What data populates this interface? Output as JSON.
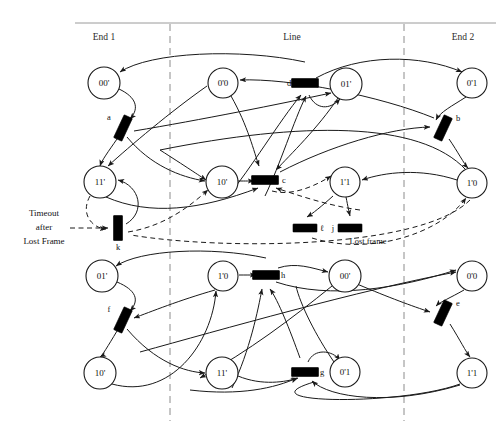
{
  "figure": {
    "kind": "petri-net",
    "background_color": "#ffffff",
    "ink_color": "#1a1a1a",
    "lane_divider_color": "#8c8c8c"
  },
  "lanes": {
    "titles": [
      {
        "id": "end1",
        "label": "End 1",
        "x": 104,
        "y": 37
      },
      {
        "id": "line",
        "label": "Line",
        "x": 292,
        "y": 37
      },
      {
        "id": "end2",
        "label": "End 2",
        "x": 463,
        "y": 37
      }
    ],
    "dividers": [
      {
        "id": "divider-left",
        "x": 170,
        "y1": 24,
        "y2": 421
      },
      {
        "id": "divider-right",
        "x": 404,
        "y1": 24,
        "y2": 421
      }
    ],
    "top_rule": {
      "x1": 75,
      "x2": 496,
      "y": 23
    }
  },
  "places": [
    {
      "id": "p-top-00a",
      "label": "00'",
      "x": 104,
      "y": 83,
      "r": 16
    },
    {
      "id": "p-top-0x0",
      "label": "0'0",
      "x": 223,
      "y": 83,
      "r": 15
    },
    {
      "id": "p-top-01a",
      "label": "01'",
      "x": 346,
      "y": 84,
      "r": 16
    },
    {
      "id": "p-top-0x1",
      "label": "0'1",
      "x": 472,
      "y": 83,
      "r": 15
    },
    {
      "id": "p-top-11a",
      "label": "11'",
      "x": 100,
      "y": 182,
      "r": 16
    },
    {
      "id": "p-top-10a",
      "label": "10'",
      "x": 222,
      "y": 182,
      "r": 16
    },
    {
      "id": "p-top-1x1",
      "label": "1'1",
      "x": 345,
      "y": 182,
      "r": 15
    },
    {
      "id": "p-top-1x0",
      "label": "1'0",
      "x": 472,
      "y": 183,
      "r": 15
    },
    {
      "id": "p-bot-01a",
      "label": "01'",
      "x": 102,
      "y": 276,
      "r": 16
    },
    {
      "id": "p-bot-1x0",
      "label": "1'0",
      "x": 223,
      "y": 276,
      "r": 15
    },
    {
      "id": "p-bot-00a",
      "label": "00'",
      "x": 345,
      "y": 276,
      "r": 16
    },
    {
      "id": "p-bot-0x0",
      "label": "0'0",
      "x": 472,
      "y": 276,
      "r": 15
    },
    {
      "id": "p-bot-10a",
      "label": "10'",
      "x": 100,
      "y": 373,
      "r": 16
    },
    {
      "id": "p-bot-11a",
      "label": "11'",
      "x": 222,
      "y": 373,
      "r": 16
    },
    {
      "id": "p-bot-0x1",
      "label": "0'1",
      "x": 345,
      "y": 372,
      "r": 15
    },
    {
      "id": "p-bot-1x1",
      "label": "1'1",
      "x": 472,
      "y": 373,
      "r": 15
    }
  ],
  "transitions": [
    {
      "id": "t-a",
      "label": "a",
      "x": 123,
      "y": 128,
      "angle": 25,
      "w": 9,
      "h": 25,
      "label_x": 109,
      "label_y": 117
    },
    {
      "id": "t-b",
      "label": "b",
      "x": 443,
      "y": 128,
      "angle": 25,
      "w": 9,
      "h": 25,
      "label_x": 458,
      "label_y": 118
    },
    {
      "id": "t-c",
      "label": "c",
      "x": 265,
      "y": 180,
      "angle": 90,
      "w": 9,
      "h": 27,
      "label_x": 284,
      "label_y": 180
    },
    {
      "id": "t-d",
      "label": "d",
      "x": 305,
      "y": 83,
      "angle": 90,
      "w": 9,
      "h": 27,
      "label_x": 289,
      "label_y": 83
    },
    {
      "id": "t-e",
      "label": "e",
      "x": 443,
      "y": 313,
      "angle": 25,
      "w": 9,
      "h": 25,
      "label_x": 458,
      "label_y": 303
    },
    {
      "id": "t-f",
      "label": "f",
      "x": 123,
      "y": 320,
      "angle": 25,
      "w": 9,
      "h": 25,
      "label_x": 109,
      "label_y": 309
    },
    {
      "id": "t-g",
      "label": "g",
      "x": 305,
      "y": 372,
      "angle": 90,
      "w": 9,
      "h": 27,
      "label_x": 322,
      "label_y": 372
    },
    {
      "id": "t-h",
      "label": "h",
      "x": 266,
      "y": 275,
      "angle": 90,
      "w": 9,
      "h": 27,
      "label_x": 283,
      "label_y": 275
    },
    {
      "id": "t-j",
      "label": "j",
      "x": 350,
      "y": 228,
      "angle": 90,
      "w": 8,
      "h": 24,
      "label_x": 333,
      "label_y": 228
    },
    {
      "id": "t-l",
      "label": "ℓ",
      "x": 305,
      "y": 228,
      "angle": 90,
      "w": 8,
      "h": 24,
      "label_x": 322,
      "label_y": 228
    },
    {
      "id": "t-k",
      "label": "k",
      "x": 118,
      "y": 228,
      "angle": 0,
      "w": 9,
      "h": 25,
      "label_x": 118,
      "label_y": 247
    }
  ],
  "annotations": [
    {
      "id": "timeout-note",
      "lines": [
        "Timeout",
        "after",
        "Lost Frame"
      ],
      "x": 44,
      "y": 228
    },
    {
      "id": "lost-frame-caption",
      "text": "Lost frame",
      "x": 368,
      "y": 241
    }
  ]
}
